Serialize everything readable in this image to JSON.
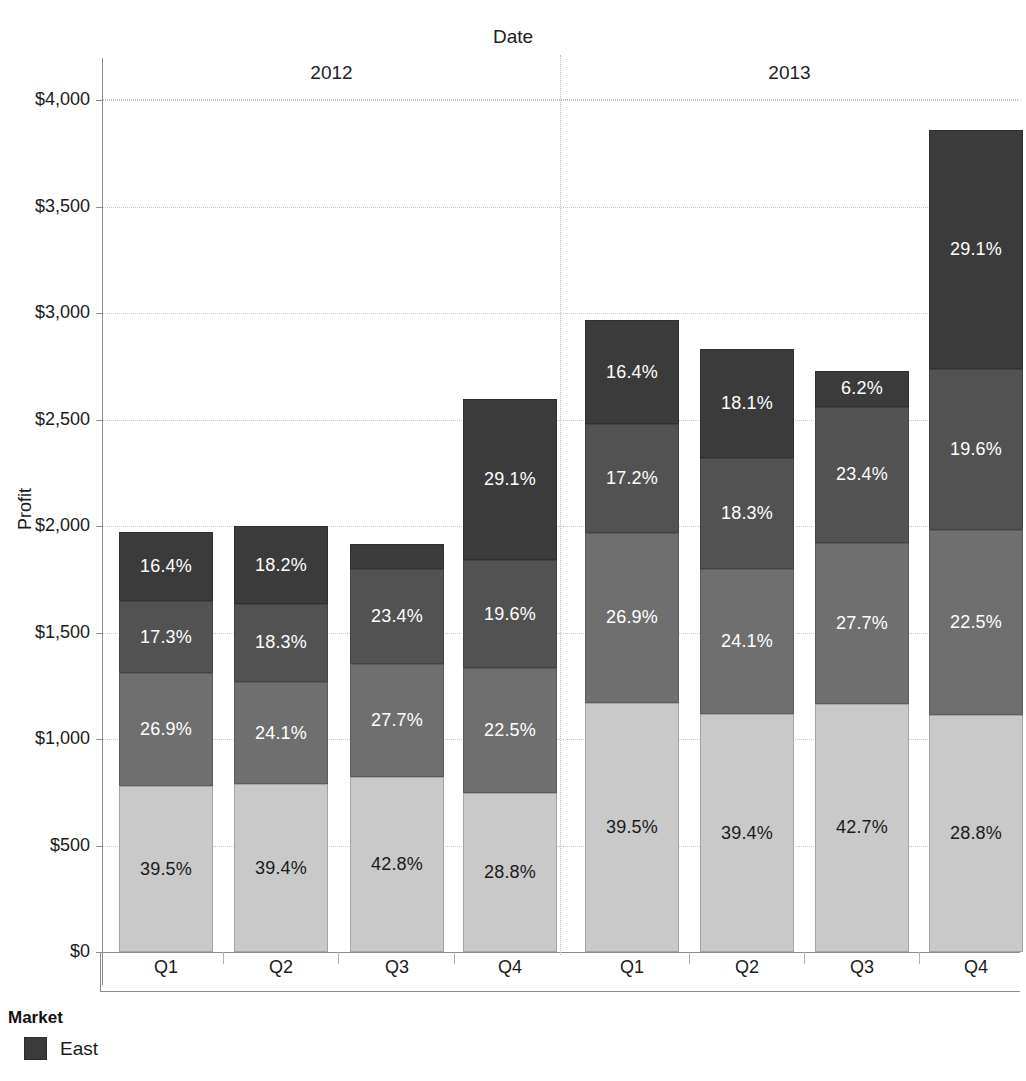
{
  "chart_data": {
    "type": "bar",
    "subtype": "stacked-bar",
    "title": "",
    "xlabel": "Date",
    "ylabel": "Profit",
    "ylim": [
      0,
      4000
    ],
    "ytick_labels": [
      "$0",
      "$500",
      "$1,000",
      "$1,500",
      "$2,000",
      "$2,500",
      "$3,000",
      "$3,500",
      "$4,000"
    ],
    "ytick_values": [
      0,
      500,
      1000,
      1500,
      2000,
      2500,
      3000,
      3500,
      4000
    ],
    "grid": true,
    "legend_position": "bottom-left",
    "legend_title": "Market",
    "group_labels": [
      "2012",
      "2013"
    ],
    "categories": [
      "Q1",
      "Q2",
      "Q3",
      "Q4",
      "Q1",
      "Q2",
      "Q3",
      "Q4"
    ],
    "series": [
      {
        "name": "East",
        "color": "#3b3b3b",
        "order": 4,
        "percent_labels": [
          "16.4%",
          "18.2%",
          "",
          "29.1%",
          "16.4%",
          "18.1%",
          "6.2%",
          "29.1%"
        ],
        "percents": [
          16.4,
          18.2,
          6.1,
          29.1,
          16.4,
          18.1,
          6.2,
          29.1
        ]
      },
      {
        "name": "West",
        "color": "#525252",
        "order": 3,
        "percent_labels": [
          "17.3%",
          "18.3%",
          "23.4%",
          "19.6%",
          "17.2%",
          "18.3%",
          "23.4%",
          "19.6%"
        ],
        "percents": [
          17.3,
          18.3,
          23.4,
          19.6,
          17.2,
          18.3,
          23.4,
          19.6
        ]
      },
      {
        "name": "Central",
        "color": "#6f6f6f",
        "order": 2,
        "percent_labels": [
          "26.9%",
          "24.1%",
          "27.7%",
          "22.5%",
          "26.9%",
          "24.1%",
          "27.7%",
          "22.5%"
        ],
        "percents": [
          26.9,
          24.1,
          27.7,
          22.5,
          26.9,
          24.1,
          27.7,
          22.5
        ]
      },
      {
        "name": "South",
        "color": "#c9c9c9",
        "order": 1,
        "percent_labels": [
          "39.5%",
          "39.4%",
          "42.8%",
          "28.8%",
          "39.5%",
          "39.4%",
          "42.7%",
          "28.8%"
        ],
        "percents": [
          39.5,
          39.4,
          42.8,
          28.8,
          39.5,
          39.4,
          42.7,
          28.8
        ]
      }
    ],
    "totals": [
      1970,
      1998,
      1915,
      2595,
      2965,
      2835,
      2730,
      3860
    ]
  },
  "legend": {
    "title": "Market",
    "entries": [
      {
        "label": "East",
        "color": "#3b3b3b"
      }
    ]
  },
  "axes": {
    "top_title": "Date",
    "y_title": "Profit"
  }
}
